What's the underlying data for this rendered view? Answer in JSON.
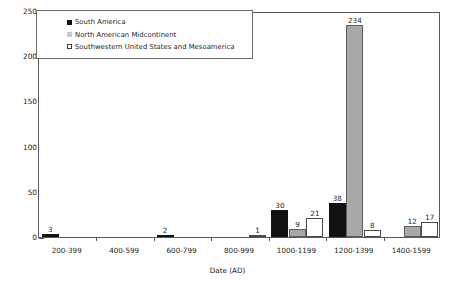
{
  "chart_data": {
    "type": "bar",
    "title": "",
    "xlabel": "Date (AD)",
    "ylabel": "Number of Diagnosed Cases",
    "categories": [
      "200-399",
      "400-599",
      "600-799",
      "800-999",
      "1000-1199",
      "1200-1399",
      "1400-1599"
    ],
    "series": [
      {
        "name": "South America",
        "color": "#121212",
        "values": [
          3,
          0,
          2,
          0,
          30,
          38,
          0
        ],
        "labels": [
          "3",
          "",
          "2",
          "",
          "30",
          "38",
          ""
        ]
      },
      {
        "name": "North American Midcontinent",
        "color": "#a8a8a8",
        "values": [
          0,
          0,
          0,
          0,
          9,
          234,
          12
        ],
        "labels": [
          "",
          "",
          "",
          "",
          "9",
          "234",
          "12"
        ]
      },
      {
        "name": "Southwestern United States and Mesoamerica",
        "color": "#ffffff",
        "values": [
          0,
          0,
          0,
          1,
          21,
          8,
          17
        ],
        "labels": [
          "",
          "",
          "",
          "1",
          "21",
          "8",
          "17"
        ]
      }
    ],
    "ylim": [
      0,
      250
    ],
    "yticks": [
      0,
      50,
      100,
      150,
      200,
      250
    ],
    "ytick_labels": [
      "0",
      "50",
      "100",
      "150",
      "200",
      "250"
    ],
    "grid": false,
    "legend_position": "top-left"
  }
}
